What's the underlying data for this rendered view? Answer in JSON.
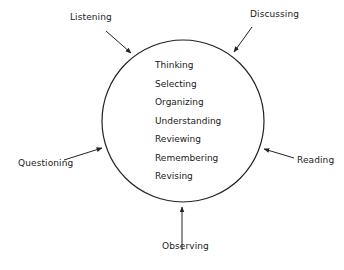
{
  "diagram": {
    "center_items": [
      "Thinking",
      "Selecting",
      "Organizing",
      "Understanding",
      "Reviewing",
      "Remembering",
      "Revising"
    ],
    "inputs": {
      "listening": "Listening",
      "discussing": "Discussing",
      "questioning": "Questioning",
      "reading": "Reading",
      "observing": "Observing"
    },
    "colors": {
      "line": "#222222",
      "text": "#1a1a1a",
      "background": "#ffffff"
    }
  }
}
